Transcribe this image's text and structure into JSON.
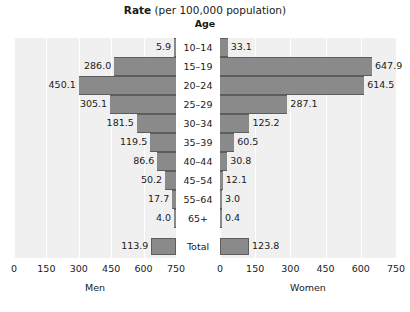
{
  "title": {
    "bold_part": "Rate",
    "rest_part": " (per 100,000 population)",
    "category_axis_title": "Age"
  },
  "chart_data": {
    "type": "bar",
    "subtype": "population-pyramid",
    "title": "Rate (per 100,000 population)",
    "xlabel": "",
    "ylabel": "Age",
    "categories": [
      "10–14",
      "15–19",
      "20–24",
      "25–29",
      "30–34",
      "35–39",
      "40–44",
      "45–54",
      "55–64",
      "65+",
      "Total"
    ],
    "series": [
      {
        "name": "Men",
        "values": [
          5.9,
          286.0,
          450.1,
          305.1,
          181.5,
          119.5,
          86.6,
          50.2,
          17.7,
          4.0,
          113.9
        ],
        "labels": [
          "5.9",
          "286.0",
          "450.1",
          "305.1",
          "181.5",
          "119.5",
          "86.6",
          "50.2",
          "17.7",
          "4.0",
          "113.9"
        ],
        "direction": "left",
        "axis_ticks": [
          750,
          600,
          450,
          300,
          150,
          0
        ],
        "axis_tick_labels": [
          "750",
          "600",
          "450",
          "300",
          "150",
          "0"
        ],
        "xlim": [
          0,
          750
        ]
      },
      {
        "name": "Women",
        "values": [
          33.1,
          647.9,
          614.5,
          287.1,
          125.2,
          60.5,
          30.8,
          12.1,
          3.0,
          0.4,
          123.8
        ],
        "labels": [
          "33.1",
          "647.9",
          "614.5",
          "287.1",
          "125.2",
          "60.5",
          "30.8",
          "12.1",
          "3.0",
          "0.4",
          "123.8"
        ],
        "direction": "right",
        "axis_ticks": [
          0,
          150,
          300,
          450,
          600,
          750
        ],
        "axis_tick_labels": [
          "0",
          "150",
          "300",
          "450",
          "600",
          "750"
        ],
        "xlim": [
          0,
          750
        ]
      }
    ],
    "grid": true,
    "legend": false,
    "bar_color": "#8a8a8a",
    "panel_background": "#f0f0f0",
    "gridline_color": "#ffffff"
  }
}
